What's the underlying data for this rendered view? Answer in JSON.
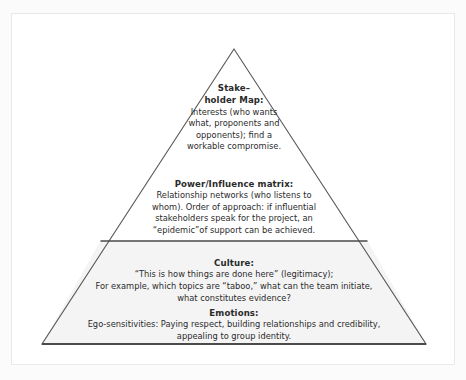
{
  "figure": {
    "type": "pyramid-diagram",
    "shape_name": "stakeholder-influence-pyramid",
    "background_color": "#ffffff",
    "outline_color": "#555555",
    "base_tier_fill": "#f4f4f4",
    "upper_tier_fill": "#ffffff",
    "text_color": "#2b2b2b"
  },
  "tiers": [
    {
      "id": "stakeholder-map",
      "position": "apex",
      "title_lines": [
        "Stake–",
        "holder Map:"
      ],
      "body_lines": [
        "Interests (who wants",
        "what, proponents and",
        "opponents); find a",
        "workable compromise."
      ]
    },
    {
      "id": "power-influence-matrix",
      "position": "upper-middle",
      "title_lines": [
        "Power/Influence matrix:"
      ],
      "body_lines": [
        "Relationship networks (who listens to",
        "whom). Order of approach: if influential",
        "stakeholders speak for the project, an",
        "“epidemic”of support can be achieved."
      ]
    },
    {
      "id": "culture",
      "position": "lower-middle",
      "title_lines": [
        "Culture:"
      ],
      "body_lines": [
        "“This is how things are done here” (legitimacy);",
        "For example, which topics are “taboo,” what can the team initiate,",
        "what constitutes evidence?"
      ]
    },
    {
      "id": "emotions",
      "position": "base",
      "title_lines": [
        "Emotions:"
      ],
      "body_lines": [
        "Ego-sensitivities: Paying respect, building relationships and credibility,",
        "appealing to group identity."
      ]
    }
  ]
}
